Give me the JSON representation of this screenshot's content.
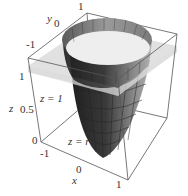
{
  "figure": {
    "surface_label": "z = r",
    "surface_exponent": "2",
    "plane_label": "z = 1",
    "axes": {
      "x": {
        "label": "x",
        "ticks": [
          "-1",
          "0",
          "1"
        ]
      },
      "y": {
        "label": "y",
        "ticks": [
          "-1",
          "0",
          "1"
        ]
      },
      "z": {
        "label": "z",
        "ticks": [
          "0",
          "0.5",
          "1"
        ]
      }
    }
  },
  "colors": {
    "plane": "#d8d8d8",
    "surface_dark": "#2a2a2a",
    "surface_mid": "#6e6e6e",
    "cap_light": "#eeeeee",
    "box_edge": "#555555"
  }
}
